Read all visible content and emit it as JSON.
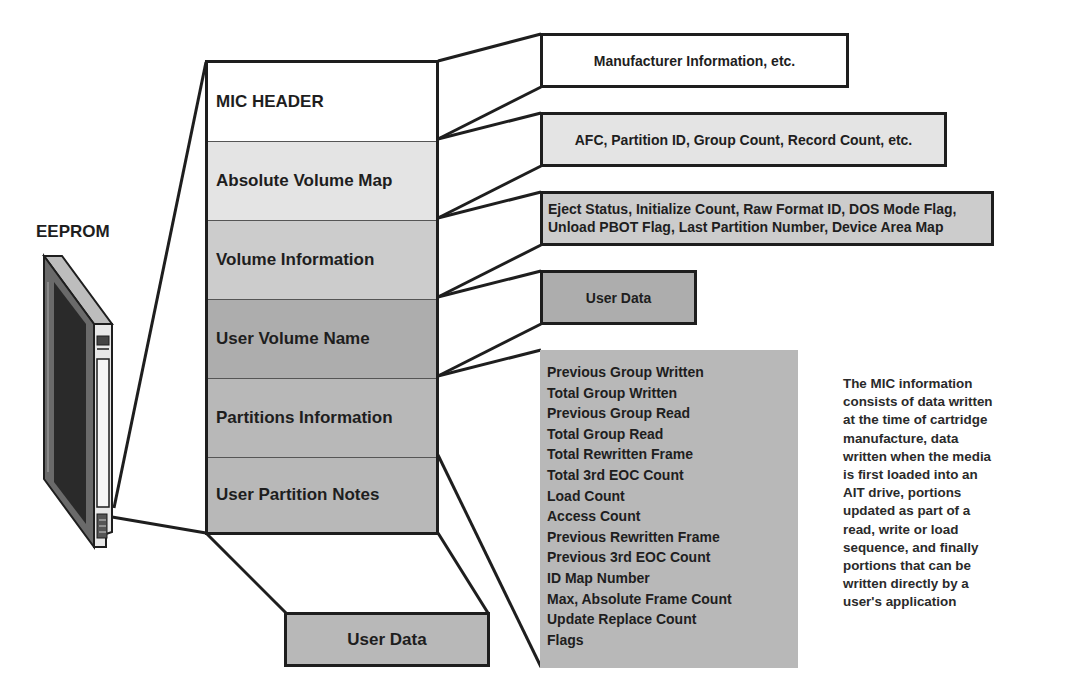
{
  "device": {
    "label": "EEPROM",
    "icon": "cartridge-icon"
  },
  "stack": {
    "segments": [
      {
        "label": "MIC HEADER",
        "color": "#ffffff"
      },
      {
        "label": "Absolute Volume Map",
        "color": "#e4e4e4"
      },
      {
        "label": "Volume Information",
        "color": "#cccccc"
      },
      {
        "label": "User Volume Name",
        "color": "#adadad"
      },
      {
        "label": "Partitions Information",
        "color": "#b8b8b8"
      },
      {
        "label": "User Partition Notes",
        "color": "#b8b8b8"
      }
    ]
  },
  "details": {
    "mic_header": {
      "text": "Manufacturer Information, etc.",
      "color": "#ffffff"
    },
    "absolute_volume_map": {
      "text": "AFC, Partition ID, Group Count, Record Count, etc.",
      "color": "#e4e4e4"
    },
    "volume_information": {
      "lines": [
        "Eject Status, Initialize Count, Raw Format ID, DOS Mode Flag,",
        "Unload PBOT Flag, Last Partition Number, Device Area Map"
      ],
      "color": "#cccccc"
    },
    "user_volume_name": {
      "text": "User Data",
      "color": "#adadad"
    },
    "partitions_information": {
      "items": [
        "Previous Group Written",
        "Total Group Written",
        "Previous Group Read",
        "Total Group Read",
        "Total Rewritten Frame",
        "Total 3rd EOC Count",
        "Load Count",
        "Access Count",
        "Previous Rewritten Frame",
        "Previous 3rd EOC Count",
        "ID Map Number",
        "Max, Absolute Frame Count",
        "Update Replace Count",
        "Flags"
      ],
      "color": "#b8b8b8"
    },
    "user_partition_notes": {
      "text": "User Data",
      "color": "#b8b8b8"
    }
  },
  "note": {
    "text": "The MIC information consists of data written at the time of cartridge manufacture, data written when the media is first loaded into an AIT drive, portions updated as part of a read, write or load sequence, and finally portions that can be written directly by a user's application",
    "lines": [
      "The MIC information",
      "consists of data written",
      "at the time of cartridge",
      "manufacture, data",
      "written when the media",
      "is first loaded into an",
      "AIT drive, portions",
      "updated as part of a",
      "read, write or load",
      "sequence, and finally",
      "portions that can be",
      "written directly by a",
      "user's application"
    ]
  }
}
